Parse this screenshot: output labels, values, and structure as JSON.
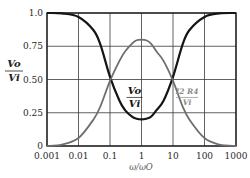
{
  "chart_data": {
    "type": "line",
    "title": "",
    "xlabel": "ω/ωO",
    "ylabel_num": "Vo",
    "ylabel_den": "Vi",
    "xscale": "log",
    "xlim": [
      0.001,
      1000
    ],
    "ylim": [
      0,
      1.0
    ],
    "grid": true,
    "x_ticks": [
      0.001,
      0.01,
      0.1,
      1,
      10,
      100,
      1000
    ],
    "x_tick_labels": [
      "0.001",
      "0.01",
      "0.1",
      "1",
      "10",
      "100",
      "1000"
    ],
    "y_ticks": [
      0,
      0.25,
      0.5,
      0.75,
      1.0
    ],
    "y_tick_labels": [
      "0",
      "0.25",
      "0.50",
      "0.75",
      "1.0"
    ],
    "series": [
      {
        "name": "Vo/Vi",
        "color": "#151515",
        "x": [
          0.001,
          0.003,
          0.01,
          0.03,
          0.05,
          0.1,
          0.2,
          0.3,
          0.5,
          0.7,
          1,
          1.4,
          2,
          3,
          5,
          10,
          20,
          33,
          100,
          300,
          1000
        ],
        "y": [
          1.0,
          0.997,
          0.97,
          0.87,
          0.76,
          0.52,
          0.34,
          0.27,
          0.22,
          0.205,
          0.2,
          0.205,
          0.22,
          0.27,
          0.34,
          0.52,
          0.76,
          0.87,
          0.97,
          0.997,
          1.0
        ]
      },
      {
        "name": "I2 R4 / Vi",
        "color": "#6e6e6e",
        "x": [
          0.001,
          0.003,
          0.01,
          0.03,
          0.05,
          0.1,
          0.2,
          0.3,
          0.5,
          0.7,
          1,
          1.4,
          2,
          3,
          5,
          10,
          20,
          33,
          100,
          300,
          1000
        ],
        "y": [
          0.0,
          0.01,
          0.06,
          0.2,
          0.3,
          0.49,
          0.64,
          0.71,
          0.77,
          0.795,
          0.8,
          0.795,
          0.77,
          0.71,
          0.64,
          0.49,
          0.3,
          0.2,
          0.06,
          0.01,
          0.0
        ]
      }
    ],
    "annotations": [
      {
        "series": "Vo/Vi",
        "num": "Vo",
        "den": "Vi",
        "at_x": 0.6,
        "at_y": 0.35,
        "color": "#151515"
      },
      {
        "series": "I2 R4 / Vi",
        "num": "I2 R4",
        "den": "Vi",
        "at_x": 28,
        "at_y": 0.35,
        "color": "#8a8a8a"
      }
    ]
  }
}
